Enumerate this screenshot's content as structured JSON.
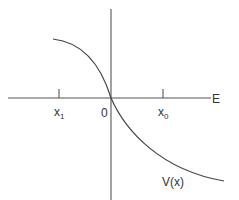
{
  "diagram": {
    "title": "",
    "axis_label_horizontal": "E",
    "origin_label": "0",
    "tick_labels": [
      {
        "name": "x",
        "subscript": "1",
        "side": "left"
      },
      {
        "name": "x",
        "subscript": "0",
        "side": "right"
      }
    ],
    "curve_label": "V(x)",
    "curve_description": "decreasing curve passing through origin, concave down on left, concave up on right"
  }
}
